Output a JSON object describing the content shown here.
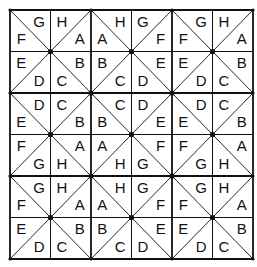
{
  "puzzle": {
    "rows": 6,
    "cols": 6,
    "grid": {
      "x0": 10,
      "y0": 10,
      "cell_w": 40.5,
      "cell_h": 41.5
    },
    "line_color": "#111111",
    "cells": [
      [
        {
          "diag": "\\",
          "tl": null,
          "tr": "G",
          "bl": "F",
          "br": null
        },
        {
          "diag": "/",
          "tl": "H",
          "tr": null,
          "bl": null,
          "br": "A"
        },
        {
          "diag": "\\",
          "tl": null,
          "tr": "H",
          "bl": "A",
          "br": null
        },
        {
          "diag": "/",
          "tl": "G",
          "tr": null,
          "bl": null,
          "br": "F"
        },
        {
          "diag": "\\",
          "tl": null,
          "tr": "G",
          "bl": "F",
          "br": null
        },
        {
          "diag": "/",
          "tl": "H",
          "tr": null,
          "bl": null,
          "br": "A"
        }
      ],
      [
        {
          "diag": "/",
          "tl": "E",
          "tr": null,
          "bl": null,
          "br": "D"
        },
        {
          "diag": "\\",
          "tl": null,
          "tr": "B",
          "bl": "C",
          "br": null
        },
        {
          "diag": "/",
          "tl": "B",
          "tr": null,
          "bl": null,
          "br": "C"
        },
        {
          "diag": "\\",
          "tl": null,
          "tr": "E",
          "bl": "D",
          "br": null
        },
        {
          "diag": "/",
          "tl": "E",
          "tr": null,
          "bl": null,
          "br": "D"
        },
        {
          "diag": "\\",
          "tl": null,
          "tr": "B",
          "bl": "C",
          "br": null
        }
      ],
      [
        {
          "diag": "\\",
          "tl": null,
          "tr": "D",
          "bl": "E",
          "br": null
        },
        {
          "diag": "/",
          "tl": "C",
          "tr": null,
          "bl": null,
          "br": "B"
        },
        {
          "diag": "\\",
          "tl": null,
          "tr": "C",
          "bl": "B",
          "br": null
        },
        {
          "diag": "/",
          "tl": "D",
          "tr": null,
          "bl": null,
          "br": "E"
        },
        {
          "diag": "\\",
          "tl": null,
          "tr": "D",
          "bl": "E",
          "br": null
        },
        {
          "diag": "/",
          "tl": "C",
          "tr": null,
          "bl": null,
          "br": "B"
        }
      ],
      [
        {
          "diag": "/",
          "tl": "F",
          "tr": null,
          "bl": null,
          "br": "G"
        },
        {
          "diag": "\\",
          "tl": null,
          "tr": "A",
          "bl": "H",
          "br": null
        },
        {
          "diag": "/",
          "tl": "A",
          "tr": null,
          "bl": null,
          "br": "H"
        },
        {
          "diag": "\\",
          "tl": null,
          "tr": "F",
          "bl": "G",
          "br": null
        },
        {
          "diag": "/",
          "tl": "F",
          "tr": null,
          "bl": null,
          "br": "G"
        },
        {
          "diag": "\\",
          "tl": null,
          "tr": "A",
          "bl": "H",
          "br": null
        }
      ],
      [
        {
          "diag": "\\",
          "tl": null,
          "tr": "G",
          "bl": "F",
          "br": null
        },
        {
          "diag": "/",
          "tl": "H",
          "tr": null,
          "bl": null,
          "br": "A"
        },
        {
          "diag": "\\",
          "tl": null,
          "tr": "H",
          "bl": "A",
          "br": null
        },
        {
          "diag": "/",
          "tl": "G",
          "tr": null,
          "bl": null,
          "br": "F"
        },
        {
          "diag": "\\",
          "tl": null,
          "tr": "G",
          "bl": "F",
          "br": null
        },
        {
          "diag": "/",
          "tl": "H",
          "tr": null,
          "bl": null,
          "br": "A"
        }
      ],
      [
        {
          "diag": "/",
          "tl": "E",
          "tr": null,
          "bl": null,
          "br": "D"
        },
        {
          "diag": "\\",
          "tl": null,
          "tr": "B",
          "bl": "C",
          "br": null
        },
        {
          "diag": "/",
          "tl": "B",
          "tr": null,
          "bl": null,
          "br": "C"
        },
        {
          "diag": "\\",
          "tl": null,
          "tr": "E",
          "bl": "D",
          "br": null
        },
        {
          "diag": "/",
          "tl": "E",
          "tr": null,
          "bl": null,
          "br": "D"
        },
        {
          "diag": "\\",
          "tl": null,
          "tr": "B",
          "bl": "C",
          "br": null
        }
      ]
    ]
  }
}
